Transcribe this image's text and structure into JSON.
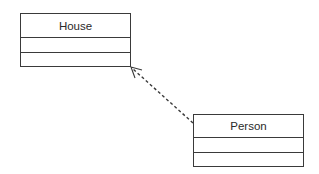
{
  "diagram": {
    "type": "UML class diagram",
    "classes": [
      {
        "name": "House",
        "attributes": [],
        "operations": []
      },
      {
        "name": "Person",
        "attributes": [],
        "operations": []
      }
    ],
    "relationships": [
      {
        "kind": "dependency",
        "style": "dashed line with open arrowhead",
        "from": "Person",
        "to": "House"
      }
    ],
    "colors": {
      "line": "#3a3a3a",
      "text": "#2a2a2a",
      "background": "#ffffff"
    }
  }
}
